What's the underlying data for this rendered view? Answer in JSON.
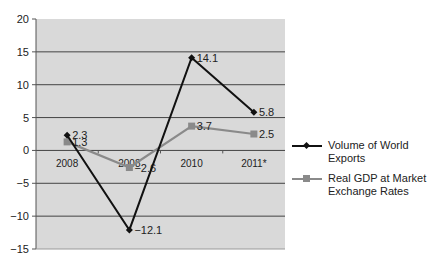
{
  "chart_data": {
    "type": "line",
    "title": "",
    "xlabel": "",
    "ylabel": "",
    "categories": [
      "2008",
      "2008",
      "2010",
      "2011*"
    ],
    "ylim": [
      -15,
      20
    ],
    "yticks": [
      20,
      15,
      10,
      5,
      0,
      -5,
      -10,
      -15
    ],
    "grid": true,
    "legend_position": "right",
    "series": [
      {
        "name": "Volume of World Exports",
        "values": [
          2.3,
          -12.1,
          14.1,
          5.8
        ],
        "labels": [
          "2.3",
          "−12.1",
          "14.1",
          "5.8"
        ],
        "color": "#111111",
        "marker": "diamond"
      },
      {
        "name": "Real GDP at Market Exchange Rates",
        "values": [
          1.3,
          -2.6,
          3.7,
          2.5
        ],
        "labels": [
          "1.3",
          "−2.6",
          "3.7",
          "2.5"
        ],
        "color": "#8a8a8a",
        "marker": "square"
      }
    ]
  },
  "legend": {
    "item0": "Volume of World Exports",
    "item1a": "Real GDP at Market",
    "item1b": "Exchange Rates"
  },
  "colors": {
    "plot_bg": "#d9d9d9",
    "grid": "#444444",
    "series1": "#111111",
    "series2": "#8a8a8a"
  }
}
